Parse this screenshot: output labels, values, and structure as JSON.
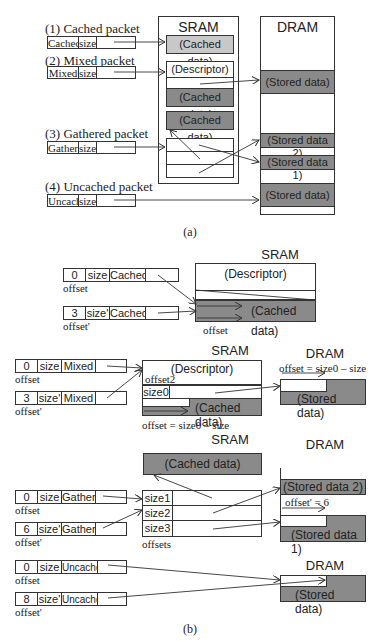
{
  "part_a": {
    "caption": "(a)",
    "sram_label": "SRAM",
    "dram_label": "DRAM",
    "packets": [
      {
        "title": "(1) Cached packet",
        "type": "Cached",
        "size": "size"
      },
      {
        "title": "(2) Mixed packet",
        "type": "Mixed",
        "size": "size"
      },
      {
        "title": "(3) Gathered packet",
        "type": "Gather",
        "size": "size"
      },
      {
        "title": "(4) Uncached packet",
        "type": "Uncach",
        "size": "size"
      }
    ],
    "sram_blocks": {
      "cached_1": "(Cached data)",
      "descriptor": "(Descriptor)",
      "cached_2": "(Cached data)",
      "cached_3": "(Cached data)"
    },
    "dram_blocks": {
      "stored_1": "(Stored data)",
      "stored_data_2": "(Stored data 2)",
      "stored_data_1": "(Stored data 1)",
      "stored_2": "(Stored data)"
    }
  },
  "part_b": {
    "caption": "(b)",
    "cached": {
      "sram_label": "SRAM",
      "descriptor": "(Descriptor)",
      "cached_data": "(Cached data)",
      "offset_label": "offset",
      "rows": [
        {
          "offset": "0",
          "size": "size",
          "type": "Cached",
          "offset_label": "offset"
        },
        {
          "offset": "3",
          "size": "size'",
          "type": "Cached",
          "offset_label": "offset'"
        }
      ]
    },
    "mixed": {
      "sram_label": "SRAM",
      "dram_label": "DRAM",
      "descriptor": "(Descriptor)",
      "offset2": "offset2",
      "size0": "size0",
      "cached_data": "(Cached data)",
      "stored_data": "(Stored data)",
      "formula_sram": "offset = size0 – size",
      "formula_dram": "offset = size0 – size",
      "rows": [
        {
          "offset": "0",
          "size": "size",
          "type": "Mixed",
          "offset_label": "offset"
        },
        {
          "offset": "3",
          "size": "size'",
          "type": "Mixed",
          "offset_label": "offset'"
        }
      ]
    },
    "gather": {
      "sram_label": "SRAM",
      "dram_label": "DRAM",
      "cached_data": "(Cached data)",
      "sizes": [
        "size1",
        "size2",
        "size3"
      ],
      "offsets_label": "offsets",
      "stored_data_2": "(Stored data 2)",
      "stored_data_1": "(Stored data 1)",
      "dram_offset": "offset' = 6",
      "rows": [
        {
          "offset": "0",
          "size": "size",
          "type": "Gather",
          "offset_label": "offset"
        },
        {
          "offset": "6",
          "size": "size'",
          "type": "Gather",
          "offset_label": "offset'"
        }
      ]
    },
    "uncached": {
      "dram_label": "DRAM",
      "stored_data": "(Stored data)",
      "rows": [
        {
          "offset": "0",
          "size": "size",
          "type": "Uncached",
          "offset_label": "offset"
        },
        {
          "offset": "8",
          "size": "size'",
          "type": "Uncached",
          "offset_label": "offset'"
        }
      ]
    }
  }
}
